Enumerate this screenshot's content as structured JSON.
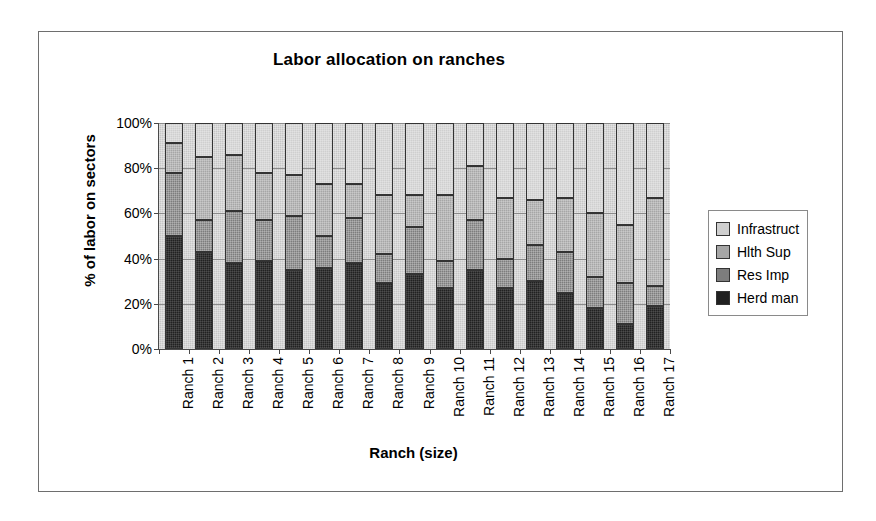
{
  "chart_data": {
    "type": "bar",
    "subtype": "stacked-100-percent",
    "title": "Labor allocation on ranches",
    "xlabel": "Ranch  (size)",
    "ylabel": "% of labor on sectors",
    "ylim": [
      0,
      100
    ],
    "yticks": [
      "0%",
      "20%",
      "40%",
      "60%",
      "80%",
      "100%"
    ],
    "ytick_values": [
      0,
      20,
      40,
      60,
      80,
      100
    ],
    "grid": true,
    "legend_position": "right",
    "categories": [
      "Ranch 1",
      "Ranch 2",
      "Ranch 3",
      "Ranch 4",
      "Ranch 5",
      "Ranch 6",
      "Ranch 7",
      "Ranch 8",
      "Ranch 9",
      "Ranch 10",
      "Ranch 11",
      "Ranch 12",
      "Ranch 13",
      "Ranch 14",
      "Ranch 15",
      "Ranch 16",
      "Ranch 17"
    ],
    "series": [
      {
        "name": "Herd man",
        "color": "#212121",
        "values": [
          50,
          43,
          38,
          39,
          35,
          36,
          38,
          29,
          33,
          27,
          35,
          27,
          30,
          25,
          18,
          11,
          19
        ]
      },
      {
        "name": "Res Imp",
        "color": "#7d7d7d",
        "values": [
          28,
          14,
          23,
          18,
          24,
          14,
          20,
          13,
          21,
          12,
          22,
          13,
          16,
          18,
          14,
          18,
          9
        ]
      },
      {
        "name": "Hlth Sup",
        "color": "#a6a6a6",
        "values": [
          13,
          28,
          25,
          21,
          18,
          23,
          15,
          26,
          14,
          29,
          24,
          27,
          20,
          24,
          28,
          26,
          39
        ]
      },
      {
        "name": "Infrastruct",
        "color": "#cfcfcf",
        "values": [
          9,
          15,
          14,
          22,
          23,
          27,
          27,
          32,
          32,
          32,
          19,
          33,
          34,
          33,
          40,
          45,
          33
        ]
      }
    ],
    "cumulative_tops": {
      "note": "stack order bottom-to-top: Herd man, Res Imp, Hlth Sup, Infrastruct",
      "Ranch 1": [
        50,
        78,
        91,
        100
      ],
      "Ranch 2": [
        43,
        57,
        85,
        100
      ],
      "Ranch 3": [
        38,
        61,
        86,
        100
      ],
      "Ranch 4": [
        39,
        57,
        78,
        100
      ],
      "Ranch 5": [
        35,
        59,
        77,
        100
      ],
      "Ranch 6": [
        36,
        50,
        73,
        100
      ],
      "Ranch 7": [
        38,
        58,
        73,
        100
      ],
      "Ranch 8": [
        29,
        42,
        68,
        100
      ],
      "Ranch 9": [
        33,
        54,
        68,
        100
      ],
      "Ranch 10": [
        27,
        39,
        68,
        100
      ],
      "Ranch 11": [
        35,
        57,
        81,
        100
      ],
      "Ranch 12": [
        27,
        40,
        67,
        100
      ],
      "Ranch 13": [
        30,
        46,
        66,
        100
      ],
      "Ranch 14": [
        25,
        43,
        67,
        100
      ],
      "Ranch 15": [
        18,
        32,
        60,
        100
      ],
      "Ranch 16": [
        11,
        29,
        55,
        100
      ],
      "Ranch 17": [
        19,
        28,
        67,
        100
      ]
    }
  },
  "legend": {
    "items": [
      {
        "label": "Infrastruct",
        "color": "#cfcfcf"
      },
      {
        "label": "Hlth Sup",
        "color": "#a6a6a6"
      },
      {
        "label": "Res Imp",
        "color": "#7d7d7d"
      },
      {
        "label": "Herd man",
        "color": "#212121"
      }
    ]
  },
  "colors": {
    "plot_background": "#c6c6c6",
    "frame_border": "#6e6e6e",
    "axis": "#4a4a4a",
    "gridline": "#8a8a8a",
    "text": "#000000"
  }
}
